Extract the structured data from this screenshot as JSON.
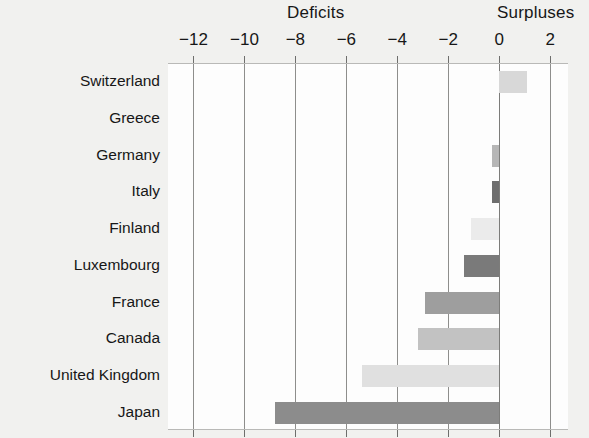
{
  "header": {
    "deficits_label": "Deficits",
    "surpluses_label": "Surpluses"
  },
  "chart_data": {
    "type": "bar",
    "orientation": "horizontal",
    "title": "",
    "xlabel": "",
    "ylabel": "",
    "xlim": [
      -13,
      2.7
    ],
    "xticks": [
      -12,
      -10,
      -8,
      -6,
      -4,
      -2,
      0,
      2
    ],
    "xtick_labels": [
      "−12",
      "−10",
      "−8",
      "−6",
      "−4",
      "−2",
      "0",
      "2"
    ],
    "grid": true,
    "legend": false,
    "zero_line": 0,
    "annotations": [
      "Deficits",
      "Surpluses"
    ],
    "categories": [
      "Switzerland",
      "Greece",
      "Germany",
      "Italy",
      "Finland",
      "Luxembourg",
      "France",
      "Canada",
      "United Kingdom",
      "Japan"
    ],
    "values": [
      1.1,
      0,
      -0.3,
      -0.3,
      -1.1,
      -1.4,
      -2.9,
      -3.2,
      -5.4,
      -8.8
    ],
    "bar_colors": [
      "#d8d8d8",
      "#d8d8d8",
      "#b6b6b6",
      "#6e6e6e",
      "#ebebeb",
      "#7a7a7a",
      "#9e9e9e",
      "#c2c2c2",
      "#e0e0e0",
      "#8c8c8c"
    ]
  },
  "colors": {
    "background": "#f1f1ef",
    "plot_background": "#fdfdfd",
    "gridline": "#8e8e8c",
    "text": "#171717"
  }
}
